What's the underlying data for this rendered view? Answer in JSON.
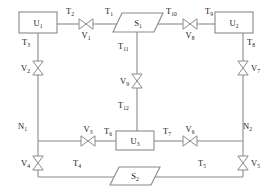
{
  "diagram": {
    "type": "process-flow",
    "colors": {
      "line": "#8a8a8a",
      "text": "#222222",
      "background": "#ffffff",
      "fill": "#ffffff"
    },
    "units": [
      {
        "id": "U1",
        "base": "U",
        "sub": "1",
        "shape": "rectangle",
        "x": 19,
        "y": 12,
        "w": 38,
        "h": 21
      },
      {
        "id": "U2",
        "base": "U",
        "sub": "2",
        "shape": "rectangle",
        "x": 215,
        "y": 12,
        "w": 38,
        "h": 21
      },
      {
        "id": "U3",
        "base": "U",
        "sub": "3",
        "shape": "rectangle",
        "x": 116,
        "y": 131,
        "w": 38,
        "h": 19
      }
    ],
    "sources": [
      {
        "id": "S1",
        "base": "S",
        "sub": "1",
        "shape": "parallelogram",
        "x": 113,
        "y": 13,
        "w": 50,
        "h": 19
      },
      {
        "id": "S2",
        "base": "S",
        "sub": "2",
        "shape": "parallelogram",
        "x": 110,
        "y": 167,
        "w": 50,
        "h": 18
      }
    ],
    "nodes": [
      {
        "id": "N1",
        "base": "N",
        "sub": "1",
        "x": 18,
        "y": 129
      },
      {
        "id": "N2",
        "base": "N",
        "sub": "2",
        "x": 243,
        "y": 129
      }
    ],
    "valves": [
      {
        "id": "V1",
        "base": "V",
        "sub": "1",
        "orientation": "horizontal",
        "cx": 86,
        "cy": 24,
        "label_pos": "below"
      },
      {
        "id": "V2",
        "base": "V",
        "sub": "2",
        "orientation": "vertical",
        "cx": 38,
        "cy": 68,
        "label_pos": "left"
      },
      {
        "id": "V3",
        "base": "V",
        "sub": "3",
        "orientation": "horizontal",
        "cx": 88,
        "cy": 141,
        "label_pos": "above"
      },
      {
        "id": "V4",
        "base": "V",
        "sub": "4",
        "orientation": "vertical",
        "cx": 38,
        "cy": 163,
        "label_pos": "left"
      },
      {
        "id": "V5",
        "base": "V",
        "sub": "5",
        "orientation": "vertical",
        "cx": 243,
        "cy": 163,
        "label_pos": "right"
      },
      {
        "id": "V6",
        "base": "V",
        "sub": "6",
        "orientation": "horizontal",
        "cx": 190,
        "cy": 141,
        "label_pos": "above"
      },
      {
        "id": "V7",
        "base": "V",
        "sub": "7",
        "orientation": "vertical",
        "cx": 243,
        "cy": 68,
        "label_pos": "right"
      },
      {
        "id": "V8",
        "base": "V",
        "sub": "8",
        "orientation": "horizontal",
        "cx": 190,
        "cy": 24,
        "label_pos": "below"
      },
      {
        "id": "V9",
        "base": "V",
        "sub": "9",
        "orientation": "vertical",
        "cx": 137,
        "cy": 81,
        "label_pos": "left"
      }
    ],
    "streams": [
      {
        "id": "T1",
        "base": "T",
        "sub": "1",
        "x": 105,
        "y": 14
      },
      {
        "id": "T2",
        "base": "T",
        "sub": "2",
        "x": 66,
        "y": 14
      },
      {
        "id": "T3",
        "base": "T",
        "sub": "3",
        "x": 22,
        "y": 45
      },
      {
        "id": "T4",
        "base": "T",
        "sub": "4",
        "x": 73,
        "y": 166
      },
      {
        "id": "T5",
        "base": "T",
        "sub": "5",
        "x": 198,
        "y": 166
      },
      {
        "id": "T6",
        "base": "T",
        "sub": "6",
        "x": 104,
        "y": 134
      },
      {
        "id": "T7",
        "base": "T",
        "sub": "7",
        "x": 163,
        "y": 134
      },
      {
        "id": "T8",
        "base": "T",
        "sub": "8",
        "x": 247,
        "y": 45
      },
      {
        "id": "T9",
        "base": "T",
        "sub": "9",
        "x": 205,
        "y": 14
      },
      {
        "id": "T10",
        "base": "T",
        "sub": "10",
        "x": 166,
        "y": 14
      },
      {
        "id": "T11",
        "base": "T",
        "sub": "11",
        "x": 118,
        "y": 49
      },
      {
        "id": "T12",
        "base": "T",
        "sub": "12",
        "x": 118,
        "y": 108
      }
    ],
    "pipes": [
      {
        "name": "u1-to-v1",
        "d": "M57 24 L79 24"
      },
      {
        "name": "v1-to-s1",
        "d": "M93 24 L120 24"
      },
      {
        "name": "s1-to-v8",
        "d": "M156 24 L183 24"
      },
      {
        "name": "v8-to-u2",
        "d": "M197 24 L215 24"
      },
      {
        "name": "u1-down-to-v2",
        "d": "M38 33 L38 61"
      },
      {
        "name": "v2-down-to-n1",
        "d": "M38 75 L38 141"
      },
      {
        "name": "n1-down-to-v4",
        "d": "M38 141 L38 156"
      },
      {
        "name": "v4-down",
        "d": "M38 170 L38 177"
      },
      {
        "name": "bottom-left",
        "d": "M38 177 L123 177"
      },
      {
        "name": "bottom-right",
        "d": "M147 177 L243 177"
      },
      {
        "name": "v5-up",
        "d": "M243 177 L243 170"
      },
      {
        "name": "n2-up-to-v5",
        "d": "M243 141 L243 156"
      },
      {
        "name": "v7-down-to-n2",
        "d": "M243 75 L243 141"
      },
      {
        "name": "u2-down-to-v7",
        "d": "M243 33 L243 61"
      },
      {
        "name": "s1-down-to-v9",
        "d": "M137 32 L137 74"
      },
      {
        "name": "v9-down-to-u3",
        "d": "M137 88 L137 131"
      },
      {
        "name": "n1-to-v3",
        "d": "M38 141 L81 141"
      },
      {
        "name": "v3-to-u3",
        "d": "M95 141 L116 141"
      },
      {
        "name": "u3-to-v6",
        "d": "M154 141 L183 141"
      },
      {
        "name": "v6-to-n2",
        "d": "M197 141 L243 141"
      }
    ]
  }
}
